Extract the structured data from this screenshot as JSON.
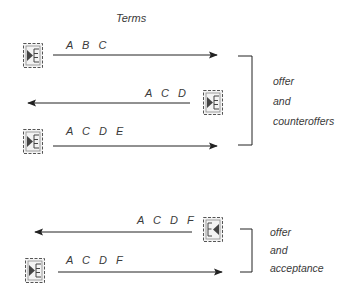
{
  "title": "Terms",
  "rows": [
    {
      "label": "A B C",
      "direction": "right"
    },
    {
      "label": "A C D",
      "direction": "left"
    },
    {
      "label": "A C D E",
      "direction": "right"
    },
    {
      "label": "A C D F",
      "direction": "left"
    },
    {
      "label": "A C D F",
      "direction": "right"
    }
  ],
  "groups": [
    {
      "lines": [
        "offer",
        "and",
        "counteroffers"
      ]
    },
    {
      "lines": [
        "offer",
        "and",
        "acceptance"
      ]
    }
  ],
  "icons": {
    "send": "document-send-icon",
    "receive": "document-receive-icon"
  },
  "colors": {
    "line": "#222222",
    "text": "#3a3a3a"
  }
}
